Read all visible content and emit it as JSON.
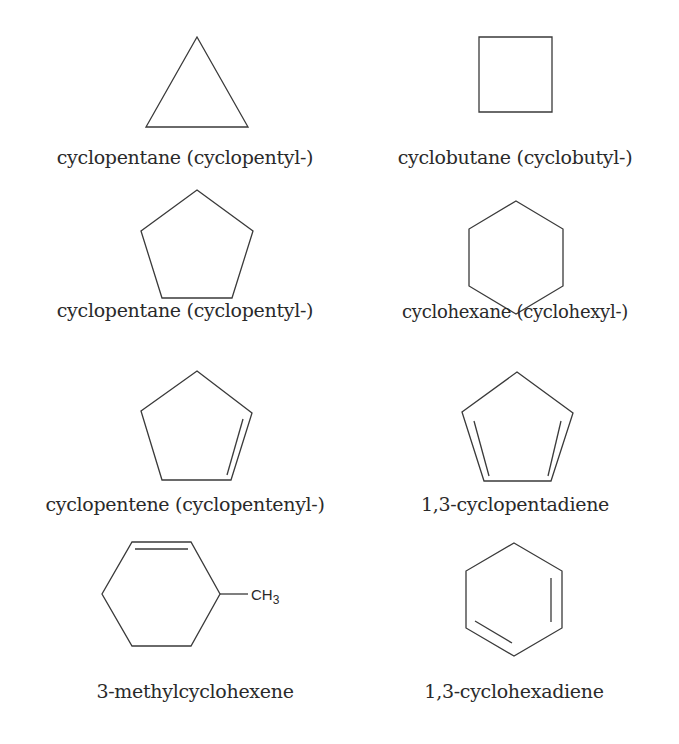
{
  "figure": {
    "structures": [
      {
        "id": "s1",
        "name": "cyclopentane (cyclopentyl-)",
        "ring": "triangle",
        "double_bonds": 0
      },
      {
        "id": "s2",
        "name": "cyclobutane (cyclobutyl-)",
        "ring": "square",
        "double_bonds": 0
      },
      {
        "id": "s3",
        "name": "cyclopentane (cyclopentyl-)",
        "ring": "pentagon",
        "double_bonds": 0
      },
      {
        "id": "s4",
        "name": "cyclohexane (cyclohexyl-)",
        "ring": "hexagon",
        "double_bonds": 0
      },
      {
        "id": "s5",
        "name": "cyclopentene (cyclopentenyl-)",
        "ring": "pentagon",
        "double_bonds": 1
      },
      {
        "id": "s6",
        "name": "1,3-cyclopentadiene",
        "ring": "pentagon",
        "double_bonds": 2
      },
      {
        "id": "s7",
        "name": "3-methylcyclohexene",
        "ring": "hexagon",
        "double_bonds": 1,
        "substituent": "CH3"
      },
      {
        "id": "s8",
        "name": "1,3-cyclohexadiene",
        "ring": "hexagon",
        "double_bonds": 2
      }
    ],
    "methyl": {
      "main": "CH",
      "subscript": "3"
    }
  }
}
